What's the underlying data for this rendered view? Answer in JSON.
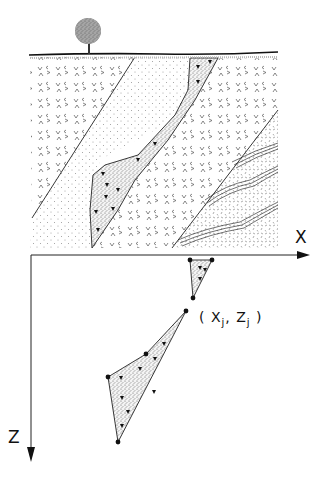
{
  "diagram": {
    "type": "geological cross-section with coordinate mapping",
    "axes": {
      "x_label": "X",
      "z_label": "Z"
    },
    "vertex_label": {
      "open": "(",
      "x": "X",
      "x_sub": "j",
      "sep": ",",
      "z": "Z",
      "z_sub": "j",
      "close": ")"
    },
    "elements": [
      {
        "name": "tree",
        "description": "tree on ground surface"
      },
      {
        "name": "ground-surface",
        "description": "topographic line"
      },
      {
        "name": "volcanic-unit-left",
        "pattern": "v-marks"
      },
      {
        "name": "sandstone-unit",
        "pattern": "dots"
      },
      {
        "name": "breccia-body",
        "pattern": "stipple with triangles"
      },
      {
        "name": "volcanic-unit-right",
        "pattern": "v-marks"
      },
      {
        "name": "bedded-unit",
        "pattern": "dashes with triple-line beds"
      }
    ],
    "polygons": [
      {
        "name": "small-breccia-polygon",
        "vertices": [
          [
            190,
            260
          ],
          [
            212,
            260
          ],
          [
            193,
            298
          ]
        ]
      },
      {
        "name": "large-breccia-polygon",
        "vertices": [
          [
            186,
            311
          ],
          [
            146,
            354
          ],
          [
            108,
            377
          ],
          [
            118,
            442
          ]
        ]
      }
    ]
  }
}
